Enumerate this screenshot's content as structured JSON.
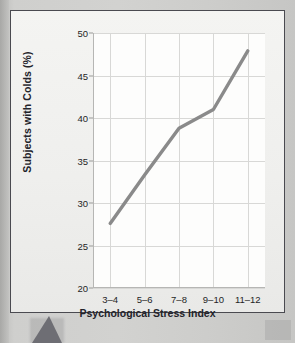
{
  "chart_data": {
    "type": "line",
    "title": "",
    "xlabel": "Psychological Stress Index",
    "ylabel": "Subjects with Colds (%)",
    "categories": [
      "3–4",
      "5–6",
      "7–8",
      "9–10",
      "11–12"
    ],
    "values": [
      27.6,
      33.3,
      38.8,
      41.0,
      47.9
    ],
    "series": [
      {
        "name": "Subjects with Colds",
        "values": [
          27.6,
          33.3,
          38.8,
          41.0,
          47.9
        ]
      }
    ],
    "ylim": [
      20,
      50
    ],
    "yticks": [
      20,
      25,
      30,
      35,
      40,
      45,
      50
    ],
    "ytick_labels": [
      "20",
      "25",
      "30",
      "35",
      "40",
      "45",
      "50"
    ],
    "xtick_labels": [
      "3–4",
      "5–6",
      "7–8",
      "9–10",
      "11–12"
    ],
    "grid": true,
    "legend": "none",
    "line_color": "#8a8a8a",
    "plot_background": "#fdfdfc",
    "grid_color": "#d8d8d6",
    "frame_color": "#4a4a50",
    "pointer_color": "#6e6e74"
  },
  "figure": {
    "y_axis_title": "Subjects with Colds (%)",
    "x_axis_title": "Psychological Stress Index"
  }
}
